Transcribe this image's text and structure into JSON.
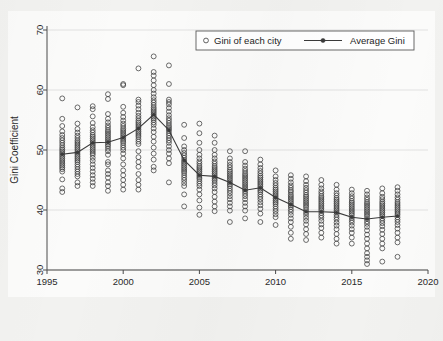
{
  "figure": {
    "background_color": "#f2f2f0",
    "paper_color": "#fbfbfa",
    "top_fragment": ""
  },
  "legend": {
    "position": "top-center",
    "entries": [
      {
        "label": "Gini of each city",
        "marker": "open-circle-marker",
        "color": "#3c3c3c"
      },
      {
        "label": "Average Gini",
        "marker": "line-with-dot-marker",
        "color": "#3a3a3a"
      }
    ]
  },
  "chart_data": {
    "type": "scatter",
    "title": "",
    "subtitle": "",
    "xlabel": "",
    "ylabel": "Gini Coefficient",
    "xlim": [
      1995,
      2020
    ],
    "ylim": [
      30,
      70
    ],
    "xticks": [
      1995,
      2000,
      2005,
      2010,
      2015,
      2020
    ],
    "yticks": [
      30,
      40,
      50,
      60,
      70
    ],
    "xtick_labels": [
      "1995",
      "2000",
      "2005",
      "2010",
      "2015",
      "2020"
    ],
    "ytick_labels": [
      "30",
      "40",
      "50",
      "60",
      "70"
    ],
    "grid": "horizontal-faint",
    "legend_position": "top-center",
    "series": [
      {
        "name": "Gini of each city",
        "type": "scatter",
        "marker": "open-circle",
        "color": "#3c3c3c",
        "points_by_year": {
          "1996": [
            58.6,
            55.2,
            54.0,
            53.1,
            52.5,
            52.0,
            51.6,
            51.2,
            50.8,
            50.4,
            50.1,
            49.8,
            49.5,
            49.2,
            48.9,
            48.6,
            48.3,
            48.0,
            47.7,
            47.4,
            47.1,
            46.8,
            46.4,
            45.1,
            43.6,
            43.0
          ],
          "1997": [
            57.1,
            54.4,
            53.5,
            52.9,
            52.4,
            52.0,
            51.6,
            51.3,
            51.0,
            50.7,
            50.4,
            50.1,
            49.8,
            49.5,
            49.2,
            48.9,
            48.6,
            48.3,
            48.0,
            47.6,
            47.2,
            46.8,
            46.4,
            46.0,
            45.6,
            44.6,
            44.0
          ],
          "1998": [
            57.3,
            56.8,
            55.6,
            54.5,
            53.8,
            53.3,
            52.9,
            52.5,
            52.2,
            51.9,
            51.6,
            51.3,
            51.0,
            50.7,
            50.4,
            50.1,
            49.8,
            49.5,
            49.2,
            48.7,
            48.2,
            47.6,
            47.0,
            46.4,
            45.8,
            45.2,
            44.6,
            44.0
          ],
          "1999": [
            59.3,
            58.5,
            56.0,
            55.2,
            54.6,
            54.1,
            53.7,
            53.3,
            53.0,
            52.7,
            52.4,
            52.1,
            51.8,
            51.5,
            51.2,
            50.9,
            50.6,
            50.2,
            49.8,
            49.2,
            48.0,
            47.6,
            46.6,
            46.0,
            45.4,
            44.6,
            44.0,
            43.2
          ],
          "2000": [
            61.0,
            60.8,
            57.2,
            56.2,
            55.5,
            54.9,
            54.4,
            54.0,
            53.6,
            53.3,
            53.0,
            52.7,
            52.4,
            52.1,
            51.8,
            51.5,
            51.2,
            50.8,
            50.4,
            50.0,
            49.4,
            48.6,
            47.6,
            46.6,
            45.8,
            45.0,
            44.2,
            43.4
          ],
          "2001": [
            63.6,
            58.4,
            58.0,
            57.4,
            56.8,
            56.2,
            55.7,
            55.3,
            54.9,
            54.6,
            54.3,
            54.0,
            53.7,
            53.4,
            53.1,
            52.8,
            52.5,
            52.2,
            51.8,
            51.4,
            51.0,
            49.8,
            48.8,
            48.0,
            47.2,
            46.0,
            45.0,
            44.2,
            43.4
          ],
          "2002": [
            65.6,
            63.0,
            62.4,
            61.6,
            60.8,
            60.0,
            59.4,
            58.8,
            58.3,
            57.9,
            57.5,
            57.1,
            56.8,
            56.5,
            56.2,
            55.9,
            55.6,
            55.3,
            55.0,
            54.6,
            54.2,
            53.6,
            53.0,
            52.2,
            51.4,
            50.4,
            49.4,
            48.4,
            47.2,
            46.6
          ],
          "2003": [
            64.1,
            61.0,
            58.4,
            58.0,
            57.6,
            57.0,
            56.4,
            55.8,
            55.3,
            54.9,
            54.5,
            54.1,
            53.8,
            53.5,
            53.2,
            52.8,
            52.4,
            52.0,
            51.6,
            51.2,
            50.6,
            50.0,
            49.4,
            48.6,
            47.8,
            44.6
          ],
          "2004": [
            54.2,
            52.0,
            50.6,
            50.0,
            49.5,
            49.1,
            48.7,
            48.3,
            48.0,
            47.7,
            47.4,
            47.1,
            46.8,
            46.5,
            46.2,
            45.8,
            45.4,
            45.0,
            44.5,
            44.0,
            42.6,
            40.6
          ],
          "2005": [
            54.4,
            52.8,
            51.2,
            50.0,
            49.2,
            48.6,
            48.1,
            47.7,
            47.3,
            47.0,
            46.7,
            46.4,
            46.1,
            45.8,
            45.5,
            45.2,
            44.8,
            44.4,
            44.0,
            43.4,
            42.6,
            41.6,
            40.4,
            39.2
          ],
          "2006": [
            52.4,
            51.2,
            50.0,
            49.2,
            48.6,
            48.1,
            47.7,
            47.3,
            47.0,
            46.7,
            46.4,
            46.1,
            45.8,
            45.5,
            45.2,
            44.9,
            44.5,
            44.1,
            43.6,
            43.0,
            42.2,
            41.4,
            40.6,
            39.8
          ],
          "2007": [
            49.8,
            48.6,
            48.0,
            47.5,
            47.1,
            46.7,
            46.4,
            46.1,
            45.8,
            45.5,
            45.2,
            44.9,
            44.6,
            44.3,
            44.0,
            43.6,
            43.2,
            42.8,
            42.3,
            41.8,
            41.2,
            40.6,
            39.9,
            38.0
          ],
          "2008": [
            49.8,
            48.0,
            47.4,
            46.9,
            46.5,
            46.1,
            45.8,
            45.5,
            45.2,
            44.9,
            44.6,
            44.3,
            44.0,
            43.7,
            43.4,
            43.1,
            42.7,
            42.3,
            41.8,
            41.2,
            40.6,
            39.9,
            38.6
          ],
          "2009": [
            48.4,
            47.6,
            47.0,
            46.5,
            46.1,
            45.7,
            45.4,
            45.1,
            44.8,
            44.5,
            44.2,
            43.9,
            43.6,
            43.3,
            43.0,
            42.6,
            42.2,
            41.8,
            41.3,
            40.8,
            40.2,
            39.4,
            38.0
          ],
          "2010": [
            46.6,
            45.6,
            45.0,
            44.5,
            44.1,
            43.7,
            43.4,
            43.1,
            42.8,
            42.5,
            42.2,
            41.9,
            41.6,
            41.3,
            41.0,
            40.6,
            40.2,
            39.8,
            39.3,
            38.8,
            37.5
          ],
          "2011": [
            45.8,
            45.2,
            44.6,
            44.1,
            43.7,
            43.3,
            43.0,
            42.6,
            42.3,
            42.0,
            41.7,
            41.4,
            41.1,
            40.8,
            40.5,
            40.1,
            39.7,
            39.2,
            38.6,
            38.0,
            37.2,
            36.2,
            35.2
          ],
          "2012": [
            45.6,
            44.8,
            44.2,
            43.7,
            43.3,
            42.9,
            42.5,
            42.2,
            41.9,
            41.6,
            41.3,
            41.0,
            40.7,
            40.4,
            40.0,
            39.6,
            39.2,
            38.7,
            38.2,
            37.6,
            36.8,
            36.0,
            35.0
          ],
          "2013": [
            45.0,
            44.2,
            43.6,
            43.1,
            42.7,
            42.3,
            42.0,
            41.7,
            41.4,
            41.1,
            40.8,
            40.5,
            40.2,
            39.9,
            39.5,
            39.1,
            38.7,
            38.2,
            37.6,
            37.0,
            36.2,
            35.4
          ],
          "2014": [
            44.2,
            43.4,
            42.8,
            42.4,
            42.0,
            41.7,
            41.4,
            41.1,
            40.8,
            40.5,
            40.2,
            39.9,
            39.6,
            39.2,
            38.8,
            38.4,
            37.9,
            37.4,
            36.8,
            36.0,
            35.2,
            34.4
          ],
          "2015": [
            43.4,
            42.8,
            42.3,
            41.9,
            41.5,
            41.2,
            40.9,
            40.6,
            40.3,
            40.0,
            39.7,
            39.4,
            39.1,
            38.7,
            38.3,
            37.9,
            37.4,
            36.8,
            36.2,
            35.4,
            34.4
          ],
          "2016": [
            43.2,
            42.6,
            42.1,
            41.7,
            41.3,
            41.0,
            40.7,
            40.4,
            40.1,
            39.8,
            39.5,
            39.2,
            38.9,
            38.5,
            38.1,
            37.7,
            37.2,
            36.6,
            35.9,
            35.2,
            34.4,
            33.6,
            32.8,
            32.2,
            31.6,
            31.0
          ],
          "2017": [
            43.6,
            42.8,
            42.2,
            41.8,
            41.4,
            41.1,
            40.8,
            40.5,
            40.2,
            39.9,
            39.6,
            39.3,
            39.0,
            38.6,
            38.2,
            37.8,
            37.3,
            36.7,
            36.0,
            35.2,
            34.4,
            33.6,
            31.4
          ],
          "2018": [
            43.8,
            43.2,
            42.6,
            42.1,
            41.7,
            41.3,
            41.0,
            40.7,
            40.4,
            40.1,
            39.8,
            39.5,
            39.2,
            38.8,
            38.4,
            38.0,
            37.5,
            36.9,
            36.2,
            35.4,
            34.6,
            32.2
          ]
        }
      },
      {
        "name": "Average Gini",
        "type": "line",
        "marker": "filled-circle",
        "color": "#3a3a3a",
        "x": [
          1996,
          1997,
          1998,
          1999,
          2000,
          2001,
          2002,
          2003,
          2004,
          2005,
          2006,
          2007,
          2008,
          2009,
          2010,
          2011,
          2012,
          2013,
          2014,
          2015,
          2016,
          2017,
          2018
        ],
        "values": [
          49.3,
          49.6,
          51.2,
          51.3,
          52.1,
          53.6,
          55.9,
          53.3,
          48.3,
          45.8,
          45.6,
          44.6,
          43.3,
          43.7,
          42.1,
          40.9,
          39.7,
          39.7,
          39.6,
          38.8,
          38.5,
          38.8,
          39.0
        ]
      }
    ]
  }
}
